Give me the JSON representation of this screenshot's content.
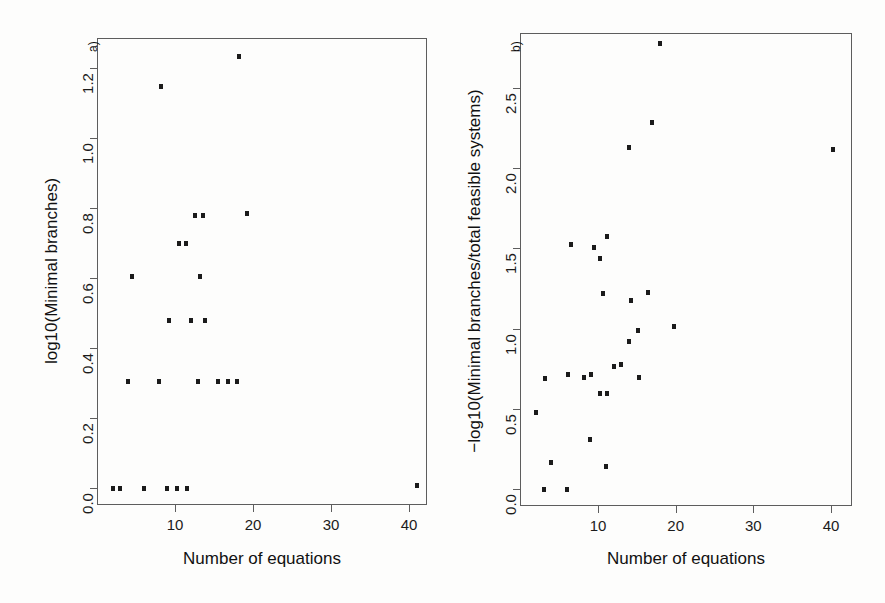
{
  "figure": {
    "background_color": "#fdfdfc",
    "marker_color": "#1b1b1b",
    "axis_color": "#5d5d5d"
  },
  "chart_data": [
    {
      "type": "scatter",
      "panel_tag": "a)",
      "title": "",
      "xlabel": "Number of equations",
      "ylabel": "log10(Minimal branches)",
      "xlim": [
        1,
        43
      ],
      "ylim": [
        -0.05,
        1.29
      ],
      "grid": false,
      "legend": "none",
      "xticks": [
        10,
        20,
        30,
        40
      ],
      "xticklabels": [
        "10",
        "20",
        "30",
        "40"
      ],
      "yticks": [
        0.0,
        0.2,
        0.4,
        0.6,
        0.8,
        1.0,
        1.2
      ],
      "yticklabels": [
        "0.0",
        "0.2",
        "0.4",
        "0.6",
        "0.8",
        "1.0",
        "1.2"
      ],
      "points": [
        {
          "x": 2.0,
          "y": 0.0
        },
        {
          "x": 3.0,
          "y": 0.0
        },
        {
          "x": 6.0,
          "y": 0.0
        },
        {
          "x": 9.0,
          "y": 0.0
        },
        {
          "x": 10.3,
          "y": 0.0
        },
        {
          "x": 11.5,
          "y": 0.0
        },
        {
          "x": 41.0,
          "y": 0.01
        },
        {
          "x": 4.0,
          "y": 0.305
        },
        {
          "x": 8.0,
          "y": 0.305
        },
        {
          "x": 13.0,
          "y": 0.305
        },
        {
          "x": 15.5,
          "y": 0.305
        },
        {
          "x": 16.8,
          "y": 0.305
        },
        {
          "x": 18.0,
          "y": 0.305
        },
        {
          "x": 9.2,
          "y": 0.48
        },
        {
          "x": 12.0,
          "y": 0.48
        },
        {
          "x": 13.8,
          "y": 0.48
        },
        {
          "x": 4.5,
          "y": 0.605
        },
        {
          "x": 13.2,
          "y": 0.605
        },
        {
          "x": 10.5,
          "y": 0.7
        },
        {
          "x": 11.4,
          "y": 0.7
        },
        {
          "x": 12.6,
          "y": 0.78
        },
        {
          "x": 13.6,
          "y": 0.78
        },
        {
          "x": 19.2,
          "y": 0.785
        },
        {
          "x": 8.2,
          "y": 1.15
        },
        {
          "x": 18.2,
          "y": 1.235
        }
      ]
    },
    {
      "type": "scatter",
      "panel_tag": "b)",
      "title": "",
      "xlabel": "Number of equations",
      "ylabel": "−log10(Minimal branches/total feasible systems)",
      "xlim": [
        1,
        43
      ],
      "ylim": [
        -0.08,
        2.86
      ],
      "grid": false,
      "legend": "none",
      "xticks": [
        10,
        20,
        30,
        40
      ],
      "xticklabels": [
        "10",
        "20",
        "30",
        "40"
      ],
      "yticks": [
        0.0,
        0.5,
        1.0,
        1.5,
        2.0,
        2.5
      ],
      "yticklabels": [
        "0.0",
        "0.5",
        "1.0",
        "1.5",
        "2.0",
        "2.5"
      ],
      "points": [
        {
          "x": 3.0,
          "y": 0.0
        },
        {
          "x": 6.0,
          "y": 0.0
        },
        {
          "x": 4.0,
          "y": 0.17
        },
        {
          "x": 11.0,
          "y": 0.145
        },
        {
          "x": 9.0,
          "y": 0.31
        },
        {
          "x": 2.0,
          "y": 0.48
        },
        {
          "x": 10.3,
          "y": 0.6
        },
        {
          "x": 11.2,
          "y": 0.6
        },
        {
          "x": 3.2,
          "y": 0.695
        },
        {
          "x": 6.2,
          "y": 0.715
        },
        {
          "x": 8.2,
          "y": 0.7
        },
        {
          "x": 9.1,
          "y": 0.72
        },
        {
          "x": 15.3,
          "y": 0.7
        },
        {
          "x": 12.0,
          "y": 0.765
        },
        {
          "x": 12.9,
          "y": 0.78
        },
        {
          "x": 14.0,
          "y": 0.92
        },
        {
          "x": 15.2,
          "y": 0.99
        },
        {
          "x": 19.8,
          "y": 1.015
        },
        {
          "x": 10.6,
          "y": 1.22
        },
        {
          "x": 14.2,
          "y": 1.18
        },
        {
          "x": 16.5,
          "y": 1.23
        },
        {
          "x": 10.2,
          "y": 1.44
        },
        {
          "x": 9.5,
          "y": 1.51
        },
        {
          "x": 6.5,
          "y": 1.53
        },
        {
          "x": 11.2,
          "y": 1.58
        },
        {
          "x": 14.0,
          "y": 2.13
        },
        {
          "x": 17.0,
          "y": 2.285
        },
        {
          "x": 18.0,
          "y": 2.78
        },
        {
          "x": 40.3,
          "y": 2.12
        }
      ]
    }
  ]
}
